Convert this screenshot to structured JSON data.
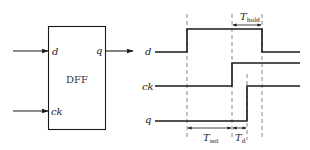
{
  "block": {
    "name": "DFF",
    "inputs": [
      "d",
      "ck"
    ],
    "output": "q"
  },
  "timing": {
    "signals": [
      {
        "name": "d",
        "transitions": "low-high-low"
      },
      {
        "name": "ck",
        "transitions": "low-high"
      },
      {
        "name": "q",
        "transitions": "low-high"
      }
    ],
    "intervals": [
      {
        "label_main": "T",
        "label_sub": "set",
        "meaning": "setup time"
      },
      {
        "label_main": "T",
        "label_sub": "d",
        "meaning": "clock-to-q delay"
      },
      {
        "label_main": "T",
        "label_sub": "hold",
        "meaning": "hold time"
      }
    ]
  },
  "colors": {
    "stroke": "#1a1a1a",
    "dash": "#555555",
    "background": "#ffffff"
  }
}
